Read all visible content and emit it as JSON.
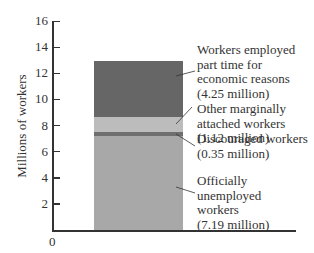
{
  "chart_data": {
    "type": "bar",
    "stacked": true,
    "title": "",
    "xlabel": "",
    "ylabel": "Millions of workers",
    "ylim": [
      0,
      16
    ],
    "yticks": [
      2,
      4,
      6,
      8,
      10,
      12,
      14,
      16
    ],
    "ytick_labels": [
      "2",
      "4",
      "6",
      "8",
      "10",
      "12",
      "14",
      "16"
    ],
    "origin_label": "0",
    "grid": false,
    "categories": [
      ""
    ],
    "series": [
      {
        "name": "Officially unemployed workers",
        "values": [
          7.19
        ],
        "label": "Officially\nunemployed\nworkers\n(7.19 million)",
        "color": "#a8a8a8"
      },
      {
        "name": "Discouraged workers",
        "values": [
          0.35
        ],
        "label": "Discouraged workers\n(0.35 million)",
        "color": "#6e6e6e"
      },
      {
        "name": "Other marginally attached workers",
        "values": [
          1.12
        ],
        "label": "Other marginally\nattached workers\n(1.12 million)",
        "color": "#bcbcbc"
      },
      {
        "name": "Workers employed part time for economic reasons",
        "values": [
          4.25
        ],
        "label": "Workers employed\npart time for\neconomic reasons\n(4.25 million)",
        "color": "#666666"
      }
    ],
    "total": 12.91
  }
}
